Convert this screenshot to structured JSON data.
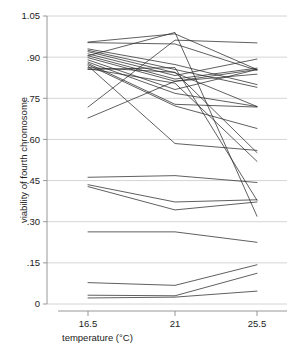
{
  "chart_data": {
    "type": "line",
    "title": "",
    "subtitle": "",
    "xlabel": "temperature (°C)",
    "ylabel": "viability of fourth chromosome",
    "x": [
      16.5,
      21,
      25.5
    ],
    "categories": [
      "16.5",
      "21",
      "25.5"
    ],
    "xtick_labels": [
      "16.5",
      "21",
      "25.5"
    ],
    "ytick_labels": [
      "0",
      ".15",
      ".30",
      ".45",
      ".60",
      ".75",
      ".90",
      "1.05"
    ],
    "ytick_values": [
      0,
      0.15,
      0.3,
      0.45,
      0.6,
      0.75,
      0.9,
      1.05
    ],
    "ylim": [
      0,
      1.05
    ],
    "xlim": [
      14.8,
      27.2
    ],
    "grid": "horizontal",
    "legend": "none",
    "line_color": "#2b2b2b",
    "grid_color": "#c9c9c9",
    "axis_color": "#8c8c8c",
    "series": [
      {
        "name": "line-01",
        "values": [
          0.955,
          0.985,
          0.855
        ]
      },
      {
        "name": "line-02",
        "values": [
          0.953,
          0.948,
          0.852
        ]
      },
      {
        "name": "line-03",
        "values": [
          0.93,
          0.873,
          0.8
        ]
      },
      {
        "name": "line-04",
        "values": [
          0.925,
          0.855,
          0.79
        ]
      },
      {
        "name": "line-05",
        "values": [
          0.92,
          0.843,
          0.72
        ]
      },
      {
        "name": "line-06",
        "values": [
          0.912,
          0.833,
          0.893
        ]
      },
      {
        "name": "line-07",
        "values": [
          0.905,
          0.82,
          0.86
        ]
      },
      {
        "name": "line-08",
        "values": [
          0.898,
          0.812,
          0.855
        ]
      },
      {
        "name": "line-09",
        "values": [
          0.89,
          0.782,
          0.855
        ]
      },
      {
        "name": "line-10",
        "values": [
          0.882,
          0.768,
          0.72
        ]
      },
      {
        "name": "line-11",
        "values": [
          0.877,
          0.728,
          0.718
        ]
      },
      {
        "name": "line-12",
        "values": [
          0.872,
          0.722,
          0.64
        ]
      },
      {
        "name": "line-13",
        "values": [
          0.868,
          0.585,
          0.56
        ]
      },
      {
        "name": "line-14",
        "values": [
          0.862,
          0.845,
          0.552
        ]
      },
      {
        "name": "line-15",
        "values": [
          0.858,
          0.805,
          0.52
        ]
      },
      {
        "name": "line-16",
        "values": [
          0.855,
          0.862,
          0.378
        ]
      },
      {
        "name": "line-17",
        "values": [
          0.718,
          0.962,
          0.952
        ]
      },
      {
        "name": "line-18",
        "values": [
          0.678,
          0.812,
          0.838
        ]
      },
      {
        "name": "line-19",
        "values": [
          0.905,
          0.99,
          0.32
        ]
      },
      {
        "name": "line-20",
        "values": [
          0.462,
          0.468,
          0.443
        ]
      },
      {
        "name": "line-21",
        "values": [
          0.435,
          0.372,
          0.38
        ]
      },
      {
        "name": "line-22",
        "values": [
          0.428,
          0.343,
          0.372
        ]
      },
      {
        "name": "line-23",
        "values": [
          0.263,
          0.263,
          0.225
        ]
      },
      {
        "name": "line-24",
        "values": [
          0.078,
          0.068,
          0.143
        ]
      },
      {
        "name": "line-25",
        "values": [
          0.032,
          0.03,
          0.112
        ]
      },
      {
        "name": "line-26",
        "values": [
          0.022,
          0.025,
          0.047
        ]
      }
    ]
  },
  "axes": {
    "x_title": "temperature (°C)",
    "y_title": "viability of fourth chromosome"
  }
}
